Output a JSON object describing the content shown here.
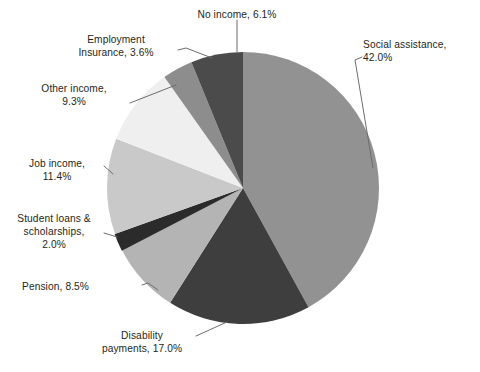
{
  "chart_data": {
    "type": "pie",
    "title": "",
    "subtitle": "",
    "xlabel": "",
    "ylabel": "",
    "legend_position": "none",
    "grid": false,
    "labels_inline": true,
    "unit": "%",
    "categories": [
      "Social assistance",
      "Disability payments",
      "Pension",
      "Student loans & scholarships",
      "Job income",
      "Other income",
      "Employment Insurance",
      "No income"
    ],
    "values": [
      42.0,
      17.0,
      8.5,
      2.0,
      11.4,
      9.3,
      3.6,
      6.1
    ],
    "slices": [
      {
        "name": "Social assistance",
        "value": 42.0,
        "label": "Social assistance,\n42.0%",
        "color": "#929292",
        "start_angle_deg": 0.0,
        "end_angle_deg": 151.2
      },
      {
        "name": "Disability payments",
        "value": 17.0,
        "label": "Disability\npayments, 17.0%",
        "color": "#3e3e3e",
        "start_angle_deg": 151.2,
        "end_angle_deg": 212.4
      },
      {
        "name": "Pension",
        "value": 8.5,
        "label": "Pension, 8.5%",
        "color": "#b4b4b4",
        "start_angle_deg": 212.4,
        "end_angle_deg": 243.0
      },
      {
        "name": "Student loans & scholarships",
        "value": 2.0,
        "label": "Student loans &\nscholarships,\n2.0%",
        "color": "#2b2b2b",
        "start_angle_deg": 243.0,
        "end_angle_deg": 250.2
      },
      {
        "name": "Job income",
        "value": 11.4,
        "label": "Job income,\n11.4%",
        "color": "#c9c9c9",
        "start_angle_deg": 250.2,
        "end_angle_deg": 291.2
      },
      {
        "name": "Other income",
        "value": 9.3,
        "label": "Other income,\n9.3%",
        "color": "#efefef",
        "start_angle_deg": 291.2,
        "end_angle_deg": 324.7
      },
      {
        "name": "Employment Insurance",
        "value": 3.6,
        "label": "Employment\nInsurance, 3.6%",
        "color": "#8d8d8d",
        "start_angle_deg": 324.7,
        "end_angle_deg": 337.7
      },
      {
        "name": "No income",
        "value": 6.1,
        "label": "No income, 6.1%",
        "color": "#4b4b4b",
        "start_angle_deg": 337.7,
        "end_angle_deg": 360.0
      }
    ],
    "total": 99.9,
    "geometry": {
      "center_x": 243,
      "center_y": 188,
      "radius": 136,
      "rotation_deg": -90
    },
    "colors": {
      "text": "#231f20",
      "leader_line": "#6d6d6d",
      "background": "#ffffff"
    }
  },
  "labels": {
    "social_assistance": "Social assistance,\n42.0%",
    "no_income": "No income, 6.1%",
    "employment_insurance": "Employment\nInsurance, 3.6%",
    "other_income": "Other income,\n9.3%",
    "job_income": "Job income,\n11.4%",
    "student_loans": "Student loans &\nscholarships,\n2.0%",
    "pension": "Pension, 8.5%",
    "disability_payments": "Disability\npayments, 17.0%"
  }
}
